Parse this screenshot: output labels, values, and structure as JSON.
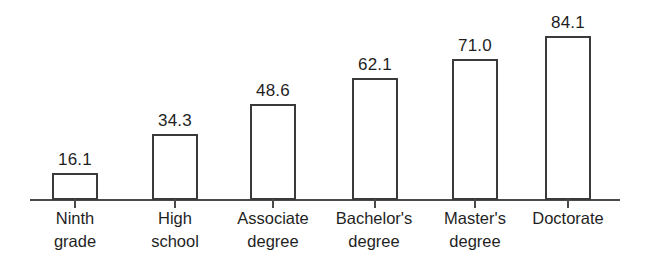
{
  "chart_data": {
    "type": "bar",
    "title": "",
    "subtitle": "",
    "xlabel": "",
    "ylabel": "",
    "ylim": [
      0,
      84.1
    ],
    "grid": false,
    "legend": false,
    "axis": {
      "baseline_visible": true,
      "y_axis_visible": false,
      "tick_marks": true
    },
    "categories": [
      "Ninth grade",
      "High school",
      "Associate degree",
      "Bachelor's degree",
      "Master's degree",
      "Doctorate"
    ],
    "values": [
      16.1,
      34.3,
      48.6,
      62.1,
      71.0,
      84.1
    ],
    "value_labels": [
      "16.1",
      "34.3",
      "48.6",
      "62.1",
      "71.0",
      "84.1"
    ],
    "bars": [
      {
        "category": "Ninth grade",
        "value": 16.1,
        "value_label": "16.1",
        "label_lines": [
          "Ninth",
          "grade"
        ],
        "left": 52,
        "width": 46,
        "top": 173,
        "height": 27,
        "tick_x": 74,
        "label_left": 24,
        "label_width": 102
      },
      {
        "category": "High school",
        "value": 34.3,
        "value_label": "34.3",
        "label_lines": [
          "High",
          "school"
        ],
        "left": 152,
        "width": 46,
        "top": 134,
        "height": 66,
        "tick_x": 174,
        "label_left": 124,
        "label_width": 102
      },
      {
        "category": "Associate degree",
        "value": 48.6,
        "value_label": "48.6",
        "label_lines": [
          "Associate",
          "degree"
        ],
        "left": 250,
        "width": 46,
        "top": 104,
        "height": 96,
        "tick_x": 272,
        "label_left": 215,
        "label_width": 116
      },
      {
        "category": "Bachelor's degree",
        "value": 62.1,
        "value_label": "62.1",
        "label_lines": [
          "Bachelor's",
          "degree"
        ],
        "left": 352,
        "width": 46,
        "top": 78,
        "height": 122,
        "tick_x": 374,
        "label_left": 313,
        "label_width": 122
      },
      {
        "category": "Master's degree",
        "value": 71.0,
        "value_label": "71.0",
        "label_lines": [
          "Master's",
          "degree"
        ],
        "left": 452,
        "width": 46,
        "top": 59,
        "height": 141,
        "tick_x": 474,
        "label_left": 420,
        "label_width": 110
      },
      {
        "category": "Doctorate",
        "value": 84.1,
        "value_label": "84.1",
        "label_lines": [
          "Doctorate"
        ],
        "left": 545,
        "width": 46,
        "top": 36,
        "height": 164,
        "tick_x": 567,
        "label_left": 513,
        "label_width": 110
      }
    ],
    "colors": {
      "background": "#ffffff",
      "bar_fill": "#ffffff",
      "bar_stroke": "#3a3a3a",
      "axis": "#4a4a4a",
      "text": "#1f1f1f"
    }
  }
}
